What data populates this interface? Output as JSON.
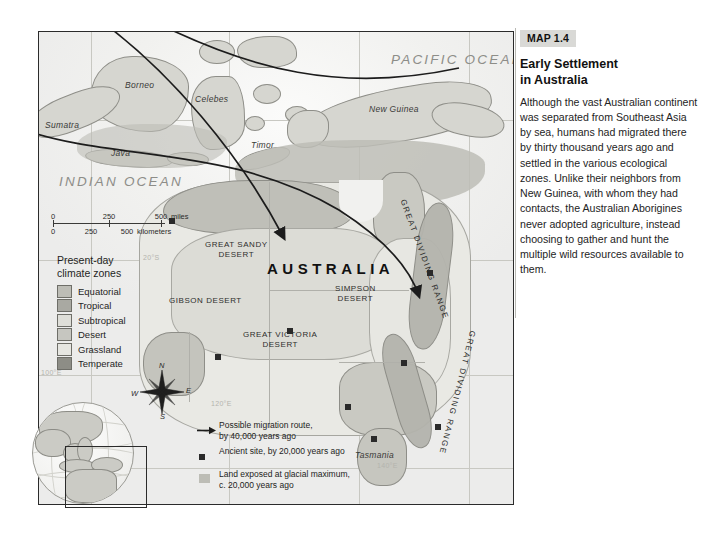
{
  "caption": {
    "badge": "MAP 1.4",
    "title": "Early Settlement in Australia",
    "title_line1": "Early Settlement",
    "title_line2": "in Australia",
    "body": "Although the vast Australian continent was separated from Southeast Asia by sea, humans had migrated there by thirty thousand years ago and settled in the various ecological zones. Unlike their neighbors from New Guinea, with whom they had contacts, the Australian Aborigines never adopted agriculture, instead choosing to gather and hunt the multiple wild resources available to them."
  },
  "map": {
    "ocean_labels": [
      {
        "name": "PACIFIC OCEAN",
        "x": 400,
        "y": 26
      },
      {
        "name": "INDIAN OCEAN",
        "x": 52,
        "y": 148
      }
    ],
    "island_labels": [
      {
        "name": "Borneo",
        "x": 95,
        "y": 55
      },
      {
        "name": "Celebes",
        "x": 165,
        "y": 68
      },
      {
        "name": "Sumatra",
        "x": 14,
        "y": 97
      },
      {
        "name": "Java",
        "x": 80,
        "y": 122
      },
      {
        "name": "Timor",
        "x": 227,
        "y": 112
      },
      {
        "name": "New Guinea",
        "x": 348,
        "y": 78
      },
      {
        "name": "Tasmania",
        "x": 350,
        "y": 422
      }
    ],
    "country_label": "AUSTRALIA",
    "desert_labels": [
      {
        "name": "GREAT SANDY\nDESERT",
        "line1": "GREAT SANDY",
        "line2": "DESERT"
      },
      {
        "name": "GIBSON DESERT",
        "line1": "GIBSON DESERT",
        "line2": ""
      },
      {
        "name": "SIMPSON\nDESERT",
        "line1": "SIMPSON",
        "line2": "DESERT"
      },
      {
        "name": "GREAT VICTORIA\nDESERT",
        "line1": "GREAT VICTORIA",
        "line2": "DESERT"
      }
    ],
    "range_labels": [
      "GREAT DIVIDING RANGE",
      "GREAT DIVIDING RANGE"
    ],
    "graticule_labels": [
      {
        "text": "20°S",
        "x": 104,
        "y": 228
      },
      {
        "text": "100°E",
        "x": 2,
        "y": 343
      },
      {
        "text": "120°E",
        "x": 172,
        "y": 374
      },
      {
        "text": "140°E",
        "x": 338,
        "y": 436
      }
    ]
  },
  "scale": {
    "miles": {
      "ticks": [
        "0",
        "250",
        "500"
      ],
      "unit": "miles"
    },
    "kilometers": {
      "ticks": [
        "0",
        "250",
        "500"
      ],
      "unit": "kilometers"
    }
  },
  "climate_legend": {
    "title_line1": "Present-day",
    "title_line2": "climate zones",
    "items": [
      {
        "label": "Equatorial",
        "color": "#bdbdb6"
      },
      {
        "label": "Tropical",
        "color": "#a9a9a2"
      },
      {
        "label": "Subtropical",
        "color": "#dedeD8"
      },
      {
        "label": "Desert",
        "color": "#c6c6c0"
      },
      {
        "label": "Grassland",
        "color": "#e6e6e1"
      },
      {
        "label": "Temperate",
        "color": "#8d8d86"
      }
    ]
  },
  "symbol_legend": {
    "items": [
      {
        "icon": "arrow-icon",
        "line1": "Possible migration route,",
        "line2": "by 40,000 years ago"
      },
      {
        "icon": "square-icon",
        "line1": "Ancient site, by 20,000 years ago",
        "line2": ""
      },
      {
        "icon": "swatch-icon",
        "line1": "Land exposed at glacial maximum,",
        "line2": "c. 20,000 years ago"
      }
    ]
  },
  "compass": {
    "north": "N",
    "east": "E",
    "south": "S",
    "west": "W"
  }
}
